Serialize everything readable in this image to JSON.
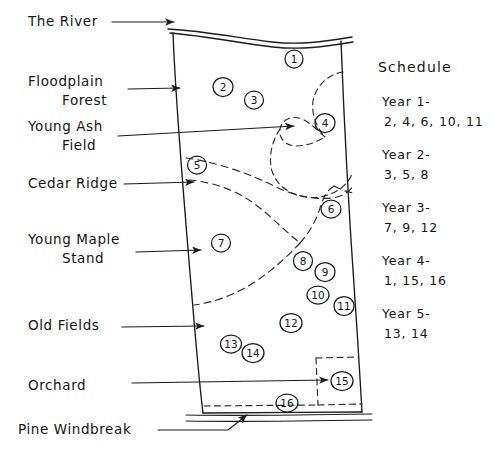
{
  "diagram": {
    "style": "hand-drawn pen sketch",
    "ink_color": "#1b1b1b",
    "paper_color": "#ffffff"
  },
  "labels": [
    {
      "id": "river",
      "lines": [
        "The River"
      ],
      "x": 28,
      "y": 26,
      "indent": 0,
      "arrow": true,
      "arrow_from": [
        112,
        22
      ],
      "arrow_to": [
        176,
        22
      ]
    },
    {
      "id": "floodplain",
      "lines": [
        "Floodplain",
        "Forest"
      ],
      "x": 28,
      "y": 86,
      "indent": 34,
      "arrow": true,
      "arrow_from": [
        128,
        88
      ],
      "arrow_to": [
        182,
        88
      ]
    },
    {
      "id": "young-ash",
      "lines": [
        "Young Ash",
        "Field"
      ],
      "x": 28,
      "y": 131,
      "indent": 34,
      "arrow": true,
      "arrow_from": [
        118,
        134
      ],
      "arrow_to": [
        296,
        126
      ]
    },
    {
      "id": "cedar-ridge",
      "lines": [
        "Cedar Ridge"
      ],
      "x": 28,
      "y": 188,
      "indent": 0,
      "arrow": true,
      "arrow_from": [
        124,
        184
      ],
      "arrow_to": [
        196,
        182
      ]
    },
    {
      "id": "young-maple",
      "lines": [
        "Young Maple",
        "Stand"
      ],
      "x": 28,
      "y": 244,
      "indent": 34,
      "arrow": true,
      "arrow_from": [
        136,
        252
      ],
      "arrow_to": [
        203,
        250
      ]
    },
    {
      "id": "old-fields",
      "lines": [
        "Old Fields"
      ],
      "x": 28,
      "y": 330,
      "indent": 0,
      "arrow": true,
      "arrow_from": [
        122,
        326
      ],
      "arrow_to": [
        206,
        326
      ]
    },
    {
      "id": "orchard",
      "lines": [
        "Orchard"
      ],
      "x": 28,
      "y": 390,
      "indent": 0,
      "arrow": true,
      "arrow_from": [
        132,
        382
      ],
      "arrow_to": [
        330,
        380
      ]
    },
    {
      "id": "pine-windbreak",
      "lines": [
        "Pine Windbreak"
      ],
      "x": 18,
      "y": 434,
      "indent": 0,
      "arrow": true,
      "arrow_from": [
        158,
        430
      ],
      "arrow_to": [
        247,
        415
      ]
    }
  ],
  "schedule": {
    "title": "Schedule",
    "entries": [
      {
        "year_label": "Year 1-",
        "units_label": "2, 4, 6, 10, 11",
        "units": [
          2,
          4,
          6,
          10,
          11
        ]
      },
      {
        "year_label": "Year 2-",
        "units_label": "3, 5, 8",
        "units": [
          3,
          5,
          8
        ]
      },
      {
        "year_label": "Year 3-",
        "units_label": "7, 9, 12",
        "units": [
          7,
          9,
          12
        ]
      },
      {
        "year_label": "Year 4-",
        "units_label": "1, 15, 16",
        "units": [
          1,
          15,
          16
        ]
      },
      {
        "year_label": "Year 5-",
        "units_label": "13, 14",
        "units": [
          13,
          14
        ]
      }
    ]
  },
  "map_units": [
    {
      "n": "1",
      "x": 294,
      "y": 59,
      "rx": 9,
      "ry": 9
    },
    {
      "n": "2",
      "x": 223,
      "y": 87,
      "rx": 10,
      "ry": 9.5
    },
    {
      "n": "3",
      "x": 254,
      "y": 100,
      "rx": 9.5,
      "ry": 9
    },
    {
      "n": "4",
      "x": 325,
      "y": 123,
      "rx": 10,
      "ry": 9.5
    },
    {
      "n": "5",
      "x": 197,
      "y": 165,
      "rx": 9.5,
      "ry": 9
    },
    {
      "n": "6",
      "x": 331,
      "y": 209,
      "rx": 10,
      "ry": 9
    },
    {
      "n": "7",
      "x": 221,
      "y": 243,
      "rx": 9.5,
      "ry": 9
    },
    {
      "n": "8",
      "x": 303,
      "y": 261,
      "rx": 9.5,
      "ry": 9.5
    },
    {
      "n": "9",
      "x": 325,
      "y": 272,
      "rx": 10,
      "ry": 9.5
    },
    {
      "n": "10",
      "x": 318,
      "y": 295,
      "rx": 11,
      "ry": 9
    },
    {
      "n": "11",
      "x": 344,
      "y": 306,
      "rx": 10,
      "ry": 9.5
    },
    {
      "n": "12",
      "x": 291,
      "y": 323,
      "rx": 11,
      "ry": 9.5
    },
    {
      "n": "13",
      "x": 231,
      "y": 344,
      "rx": 10.5,
      "ry": 9
    },
    {
      "n": "14",
      "x": 253,
      "y": 353,
      "rx": 11,
      "ry": 9.5
    },
    {
      "n": "15",
      "x": 342,
      "y": 381,
      "rx": 11,
      "ry": 9.5
    },
    {
      "n": "16",
      "x": 287,
      "y": 403,
      "rx": 11,
      "ry": 9
    }
  ],
  "regions": {
    "river_note": "double wavy line across top of parcel",
    "parcel_note": "tall quadrilateral, left edge slanting right toward bottom",
    "orchard_note": "dashed rectangle at lower right",
    "windbreak_note": "narrow double-line band along bottom edge"
  }
}
